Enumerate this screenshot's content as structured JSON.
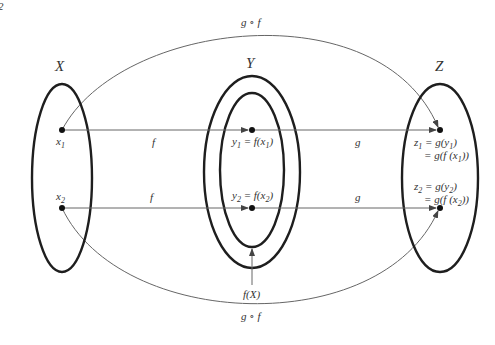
{
  "diagram": {
    "corner_mark": "2",
    "sets": {
      "X": {
        "label": "X"
      },
      "Y": {
        "label": "Y",
        "image_label": "f(X)"
      },
      "Z": {
        "label": "Z"
      }
    },
    "points": {
      "x1": {
        "base": "x",
        "sub": "1"
      },
      "x2": {
        "base": "x",
        "sub": "2"
      },
      "y1": {
        "text_a": "y",
        "sub_a": "1",
        "eq": " = f(x",
        "sub_b": "1",
        "close": ")"
      },
      "y2": {
        "text_a": "y",
        "sub_a": "2",
        "eq": " = f(x",
        "sub_b": "2",
        "close": ")"
      },
      "z1": {
        "line1_a": "z",
        "line1_sub": "1",
        "line1_b": " = g(y",
        "line1_sub2": "1",
        "line1_c": ")",
        "line2_a": "= g(f (x",
        "line2_sub": "1",
        "line2_c": "))"
      },
      "z2": {
        "line1_a": "z",
        "line1_sub": "2",
        "line1_b": " = g(y",
        "line1_sub2": "2",
        "line1_c": ")",
        "line2_a": "= g(f (x",
        "line2_sub": "2",
        "line2_c": "))"
      }
    },
    "arrows": {
      "f_top": "f",
      "f_bottom": "f",
      "g_top": "g",
      "g_bottom": "g",
      "composite_top": "g ∘ f",
      "composite_bottom": "g ∘ f"
    },
    "colors": {
      "set_stroke": "#1e1e1e",
      "arrow_stroke": "#666666",
      "text": "#333333"
    }
  }
}
